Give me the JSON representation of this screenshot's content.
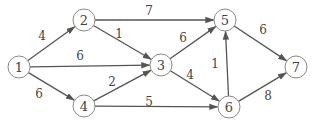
{
  "diagram": {
    "type": "directed-weighted-graph",
    "colors": {
      "edge": "#555555",
      "node_stroke": "#8a8a8a",
      "text": "#444444",
      "background": "#ffffff"
    },
    "node_radius": 11,
    "nodes": [
      {
        "id": "1",
        "label": "1",
        "x": 19,
        "y": 67
      },
      {
        "id": "2",
        "label": "2",
        "x": 84,
        "y": 20
      },
      {
        "id": "3",
        "label": "3",
        "x": 161,
        "y": 65
      },
      {
        "id": "4",
        "label": "4",
        "x": 84,
        "y": 106
      },
      {
        "id": "5",
        "label": "5",
        "x": 225,
        "y": 20
      },
      {
        "id": "6",
        "label": "6",
        "x": 229,
        "y": 107
      },
      {
        "id": "7",
        "label": "7",
        "x": 296,
        "y": 67
      }
    ],
    "edges": [
      {
        "from": "1",
        "to": "2",
        "weight": "4",
        "lx": 42,
        "ly": 36
      },
      {
        "from": "1",
        "to": "3",
        "weight": "6",
        "lx": 80,
        "ly": 56
      },
      {
        "from": "1",
        "to": "4",
        "weight": "6",
        "lx": 39,
        "ly": 94
      },
      {
        "from": "2",
        "to": "5",
        "weight": "7",
        "lx": 149,
        "ly": 11
      },
      {
        "from": "2",
        "to": "3",
        "weight": "1",
        "lx": 119,
        "ly": 34
      },
      {
        "from": "4",
        "to": "3",
        "weight": "2",
        "lx": 112,
        "ly": 82
      },
      {
        "from": "4",
        "to": "6",
        "weight": "5",
        "lx": 149,
        "ly": 102
      },
      {
        "from": "3",
        "to": "5",
        "weight": "6",
        "lx": 183,
        "ly": 38
      },
      {
        "from": "3",
        "to": "6",
        "weight": "4",
        "lx": 190,
        "ly": 75
      },
      {
        "from": "6",
        "to": "5",
        "weight": "1",
        "lx": 215,
        "ly": 64
      },
      {
        "from": "5",
        "to": "7",
        "weight": "6",
        "lx": 263,
        "ly": 30
      },
      {
        "from": "6",
        "to": "7",
        "weight": "8",
        "lx": 268,
        "ly": 96
      }
    ]
  }
}
